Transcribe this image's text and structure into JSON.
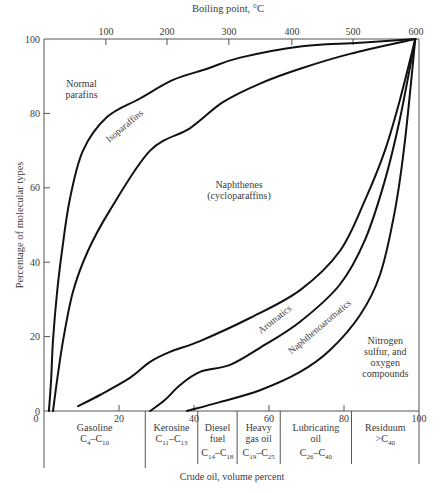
{
  "chart_data": {
    "type": "area",
    "title": "",
    "xlabel": "Crude oil, volume percent",
    "ylabel": "Percentage of molecular types",
    "top_axis_label": "Boiling point, °C",
    "xlim": [
      0,
      100
    ],
    "ylim": [
      0,
      100
    ],
    "grid": false,
    "x_ticks": [
      0,
      20,
      40,
      60,
      80,
      100
    ],
    "y_ticks": [
      0,
      20,
      40,
      60,
      80,
      100
    ],
    "top_ticks": [
      {
        "label": "100",
        "x": 16.5
      },
      {
        "label": "200",
        "x": 32.8
      },
      {
        "label": "300",
        "x": 49.3
      },
      {
        "label": "400",
        "x": 66.1
      },
      {
        "label": "500",
        "x": 82.4
      },
      {
        "label": "600",
        "x": 99.2
      }
    ],
    "boundaries": [
      {
        "name": "Normal paraffins / Isoparaffins",
        "points": [
          [
            1.3,
            0
          ],
          [
            1.9,
            8.3
          ],
          [
            2.4,
            19
          ],
          [
            3.5,
            32
          ],
          [
            4.8,
            43
          ],
          [
            6.9,
            57
          ],
          [
            10.4,
            70
          ],
          [
            16.8,
            79
          ],
          [
            25.6,
            84
          ],
          [
            34.4,
            89
          ],
          [
            43.5,
            92
          ],
          [
            52.3,
            95
          ],
          [
            68.3,
            98
          ],
          [
            84.3,
            99
          ],
          [
            99,
            100
          ]
        ]
      },
      {
        "name": "Isoparaffins / Naphthenes",
        "points": [
          [
            2.4,
            0
          ],
          [
            3.5,
            8.3
          ],
          [
            5.1,
            19
          ],
          [
            7.7,
            32
          ],
          [
            11.7,
            43
          ],
          [
            17.6,
            54
          ],
          [
            28.3,
            70
          ],
          [
            38.9,
            76
          ],
          [
            47.7,
            83
          ],
          [
            57.6,
            88
          ],
          [
            68.3,
            92
          ],
          [
            81.6,
            96
          ],
          [
            99,
            100
          ]
        ]
      },
      {
        "name": "Naphthenes / Aromatics",
        "points": [
          [
            9.1,
            1.3
          ],
          [
            14.9,
            4.3
          ],
          [
            22.9,
            8.9
          ],
          [
            28.3,
            13.2
          ],
          [
            33.6,
            15.9
          ],
          [
            41.6,
            18.8
          ],
          [
            54.9,
            25
          ],
          [
            68.3,
            32.5
          ],
          [
            78.9,
            43
          ],
          [
            85.6,
            56.7
          ],
          [
            90.9,
            70
          ],
          [
            94.9,
            83.6
          ],
          [
            99,
            100
          ]
        ]
      },
      {
        "name": "Aromatics / Naphthenoaromatics",
        "points": [
          [
            28.3,
            0
          ],
          [
            32.3,
            3
          ],
          [
            36.3,
            7
          ],
          [
            41.6,
            10.5
          ],
          [
            49.6,
            12.4
          ],
          [
            57.6,
            17
          ],
          [
            68.3,
            24
          ],
          [
            78.9,
            34
          ],
          [
            85.6,
            46
          ],
          [
            90.9,
            62
          ],
          [
            94.9,
            78.5
          ],
          [
            99,
            100
          ]
        ]
      },
      {
        "name": "Naphthenoaromatics / N,S,O compounds",
        "points": [
          [
            38.1,
            0
          ],
          [
            46.9,
            2.4
          ],
          [
            57.6,
            5.6
          ],
          [
            68.3,
            10.5
          ],
          [
            76.3,
            16.4
          ],
          [
            84.3,
            25.8
          ],
          [
            89.6,
            36.6
          ],
          [
            93.6,
            54
          ],
          [
            96.3,
            73
          ],
          [
            99,
            100
          ]
        ]
      }
    ],
    "region_labels": [
      {
        "text": "Normal parafins",
        "lines": [
          "Normal",
          "parafins"
        ],
        "x": 10,
        "y": 87
      },
      {
        "text": "Isoparaffins",
        "x": 22,
        "y": 76,
        "rotate": -40
      },
      {
        "text": "Naphthenes (cycloparaffins)",
        "lines": [
          "Naphthenes",
          "(cycloparaffins)"
        ],
        "x": 52,
        "y": 60
      },
      {
        "text": "Aromatics",
        "x": 62,
        "y": 24,
        "rotate": -38
      },
      {
        "text": "Naphthenoaromatics",
        "x": 74,
        "y": 22,
        "rotate": -40
      },
      {
        "text": "Nitrogen sulfur, and oxygen compounds",
        "lines": [
          "Nitrogen",
          "sulfur, and",
          "oxygen",
          "compounds"
        ],
        "x": 91,
        "y": 18
      }
    ],
    "fractions": [
      {
        "name": "Gasoline",
        "formula": "C4–C10",
        "start": 0,
        "end": 27
      },
      {
        "name": "Kerosine",
        "formula": "C11–C13",
        "start": 27,
        "end": 41
      },
      {
        "name": "Diesel fuel",
        "formula": "C14–C18",
        "start": 41,
        "end": 51.5
      },
      {
        "name": "Heavy gas oil",
        "formula": "C19–C25",
        "start": 51.5,
        "end": 63
      },
      {
        "name": "Lubricating oil",
        "formula": "C26–C40",
        "start": 63,
        "end": 82
      },
      {
        "name": "Residuum",
        "formula": ">C40",
        "start": 82,
        "end": 100
      }
    ]
  },
  "labels": {
    "top_axis_title": "Boiling point, °C",
    "y_axis_title": "Percentage of molecular types",
    "x_axis_title": "Crude oil, volume percent"
  }
}
